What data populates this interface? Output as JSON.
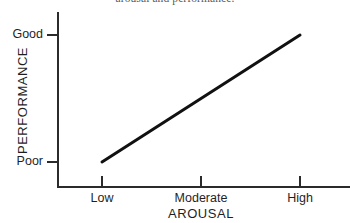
{
  "caption": {
    "fragment_text": "arousal and performance."
  },
  "figure": {
    "background_color": "#ffffff",
    "ink_color": "#2b2b2b",
    "line_color": "#111111"
  },
  "axes": {
    "y_title": "PERFORMANCE",
    "x_title": "AROUSAL",
    "y_ticks": [
      {
        "label": "Good",
        "value": 1
      },
      {
        "label": "Poor",
        "value": 0
      }
    ],
    "x_ticks": [
      {
        "label": "Low",
        "value": 0
      },
      {
        "label": "Moderate",
        "value": 1
      },
      {
        "label": "High",
        "value": 2
      }
    ]
  },
  "chart_data": {
    "type": "line",
    "title": "",
    "subtitle": "",
    "xlabel": "AROUSAL",
    "ylabel": "PERFORMANCE",
    "x": [
      "Low",
      "Moderate",
      "High"
    ],
    "xtick_labels": [
      "Low",
      "Moderate",
      "High"
    ],
    "ytick_labels": [
      "Poor",
      "Good"
    ],
    "xlim": [
      0,
      2
    ],
    "ylim": [
      0,
      1
    ],
    "grid": false,
    "legend": false,
    "legend_position": "none",
    "annotations": [],
    "series": [
      {
        "name": "Performance vs Arousal",
        "color": "#111111",
        "line_width_px": 3,
        "values": [
          0.0,
          0.5,
          1.0
        ],
        "points": [
          {
            "x": "Low",
            "y": 0.0,
            "y_label": "Poor"
          },
          {
            "x": "Moderate",
            "y": 0.5,
            "y_label": ""
          },
          {
            "x": "High",
            "y": 1.0,
            "y_label": "Good"
          }
        ]
      }
    ]
  }
}
